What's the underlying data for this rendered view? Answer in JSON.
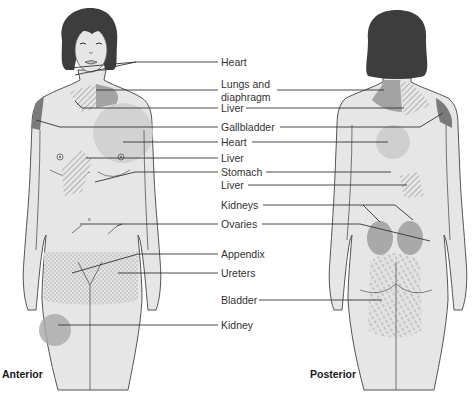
{
  "diagram": {
    "colors": {
      "skin": "#e6e6e6",
      "outline": "#555555",
      "hair": "#3d3d3d",
      "zone_dark": "#7a7a7a",
      "zone_mid": "#a9a9a9",
      "zone_light": "#cfcfcf",
      "leader": "#333333"
    },
    "views": [
      {
        "id": "anterior",
        "label": "Anterior"
      },
      {
        "id": "posterior",
        "label": "Posterior"
      }
    ],
    "labels": [
      {
        "id": "heart1",
        "text": "Heart"
      },
      {
        "id": "lungs",
        "text": "Lungs and"
      },
      {
        "id": "lungs2",
        "text": "diaphragm"
      },
      {
        "id": "liver1",
        "text": "Liver"
      },
      {
        "id": "gallbladder",
        "text": "Gallbladder"
      },
      {
        "id": "heart2",
        "text": "Heart"
      },
      {
        "id": "liver2",
        "text": "Liver"
      },
      {
        "id": "stomach",
        "text": "Stomach"
      },
      {
        "id": "liver3",
        "text": "Liver"
      },
      {
        "id": "kidneys",
        "text": "Kidneys"
      },
      {
        "id": "ovaries",
        "text": "Ovaries"
      },
      {
        "id": "appendix",
        "text": "Appendix"
      },
      {
        "id": "ureters",
        "text": "Ureters"
      },
      {
        "id": "bladder",
        "text": "Bladder"
      },
      {
        "id": "kidney",
        "text": "Kidney"
      }
    ]
  }
}
